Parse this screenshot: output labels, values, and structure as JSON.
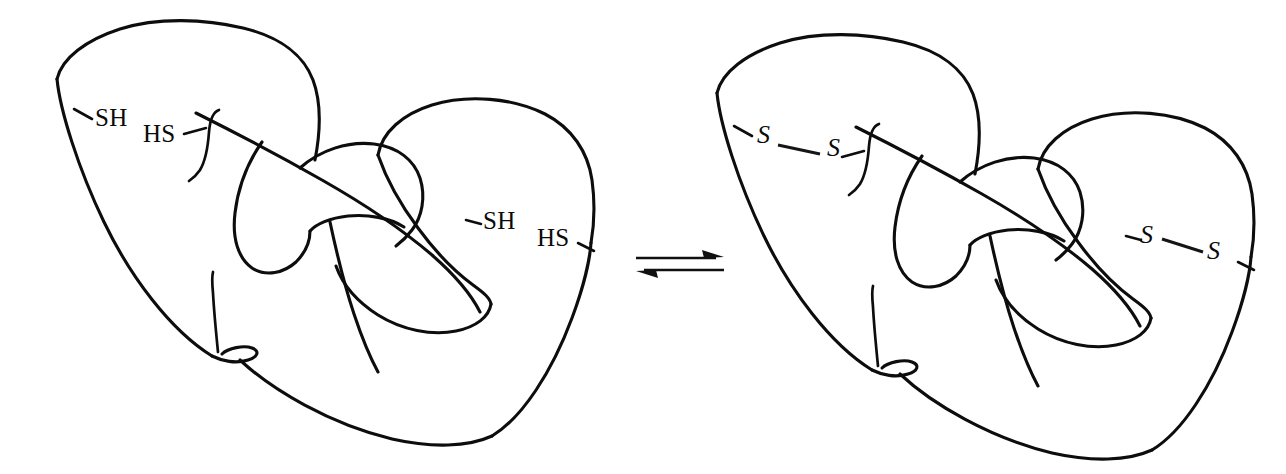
{
  "figure": {
    "caption": "",
    "background_color": "#ffffff",
    "ink_color": "#0d0d0d",
    "width": 1286,
    "height": 474
  },
  "reaction": {
    "operator_symbol": "⇌",
    "operator_name": "equilibrium-arrow",
    "direction": "reversible",
    "left_state_name": "reduced-protein",
    "right_state_name": "oxidized-protein"
  },
  "left_structure": {
    "name": "reduced-polypeptide",
    "state": "reduced",
    "labels": [
      {
        "id": "sh-upper-left",
        "text": "SH",
        "x": 95,
        "y": 126,
        "anchor": "start",
        "size": 25
      },
      {
        "id": "hs-upper-right",
        "text": "HS",
        "x": 143,
        "y": 142,
        "anchor": "start",
        "size": 25
      },
      {
        "id": "sh-lower-left",
        "text": "SH",
        "x": 483,
        "y": 229,
        "anchor": "start",
        "size": 25
      },
      {
        "id": "hs-lower-right",
        "text": "HS",
        "x": 537,
        "y": 246,
        "anchor": "start",
        "size": 25
      }
    ],
    "thiol_count": 4,
    "disulfide_count": 0
  },
  "right_structure": {
    "name": "oxidized-polypeptide",
    "state": "oxidized",
    "labels": [
      {
        "id": "s-upper-left",
        "text": "S",
        "x": 757,
        "y": 143,
        "anchor": "start",
        "size": 26
      },
      {
        "id": "s-upper-right",
        "text": "S",
        "x": 827,
        "y": 156,
        "anchor": "start",
        "size": 26
      },
      {
        "id": "s-lower-left",
        "text": "S",
        "x": 1140,
        "y": 243,
        "anchor": "start",
        "size": 26
      },
      {
        "id": "s-lower-right",
        "text": "S",
        "x": 1207,
        "y": 259,
        "anchor": "start",
        "size": 26
      }
    ],
    "thiol_count": 0,
    "disulfide_count": 2,
    "disulfide_bonds": [
      {
        "id": "disulfide-upper",
        "from": "s-upper-left",
        "to": "s-upper-right"
      },
      {
        "id": "disulfide-lower",
        "from": "s-lower-left",
        "to": "s-lower-right"
      }
    ]
  },
  "arrow": {
    "name": "equilibrium-arrow",
    "x_start": 636,
    "x_end": 724,
    "y_top": 258,
    "y_bottom": 272
  }
}
